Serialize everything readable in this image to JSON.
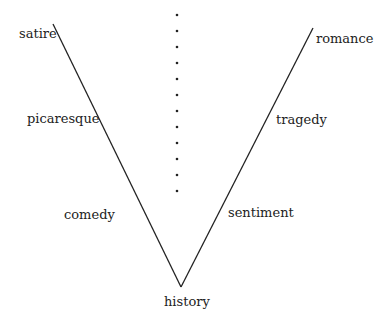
{
  "diagram": {
    "labels": {
      "satire": "satire",
      "picaresque": "picaresque",
      "comedy": "comedy",
      "romance": "romance",
      "tragedy": "tragedy",
      "sentiment": "sentiment",
      "history": "history"
    },
    "left_arm": [
      "satire",
      "picaresque",
      "comedy"
    ],
    "right_arm": [
      "romance",
      "tragedy",
      "sentiment"
    ],
    "vertex": "history",
    "dot_count": 12,
    "line_color": "#222222"
  }
}
